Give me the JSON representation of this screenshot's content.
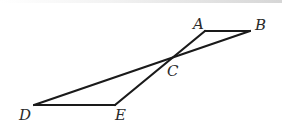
{
  "figure": {
    "type": "geometry",
    "points": {
      "A": {
        "label": "A",
        "x": 205,
        "y": 31,
        "label_x": 193,
        "label_y": 29
      },
      "B": {
        "label": "B",
        "x": 250,
        "y": 31,
        "label_x": 255,
        "label_y": 30
      },
      "C": {
        "label": "C",
        "x": 170,
        "y": 59,
        "label_x": 167,
        "label_y": 76
      },
      "D": {
        "label": "D",
        "x": 34,
        "y": 105,
        "label_x": 19,
        "label_y": 120
      },
      "E": {
        "label": "E",
        "x": 115,
        "y": 105,
        "label_x": 115,
        "label_y": 120
      }
    },
    "segments": [
      {
        "from": "A",
        "to": "B"
      },
      {
        "from": "A",
        "to": "E"
      },
      {
        "from": "B",
        "to": "D"
      },
      {
        "from": "D",
        "to": "E"
      }
    ],
    "stroke_color": "#1a1a1a",
    "label_color": "#2a2a2a"
  }
}
